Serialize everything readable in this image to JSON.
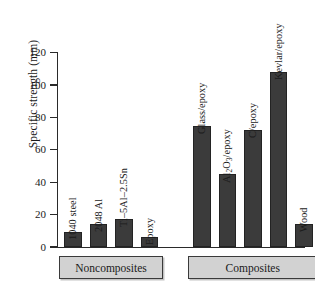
{
  "chart_data": {
    "type": "bar",
    "title": "",
    "xlabel": "",
    "ylabel": "Specific strength (mm)",
    "ylim": [
      0,
      120
    ],
    "yticks": [
      0,
      20,
      40,
      60,
      80,
      100,
      120
    ],
    "grid": false,
    "legend": null,
    "categories": [
      "1040 steel",
      "2048 Al",
      "Ti–5Al–2.5Sn",
      "Epoxy",
      "Glass/epoxy",
      "Al2O3/epoxy",
      "C/epoxy",
      "Kevlar/epoxy",
      "Wood"
    ],
    "values": [
      9,
      14,
      17,
      6,
      75,
      45,
      72,
      108,
      14
    ],
    "bars": [
      {
        "label": "1040 steel",
        "value": 9,
        "group": "Noncomposites"
      },
      {
        "label": "2048 Al",
        "value": 14,
        "group": "Noncomposites"
      },
      {
        "label": "Ti–5Al–2.5Sn",
        "value": 17,
        "group": "Noncomposites"
      },
      {
        "label": "Epoxy",
        "value": 6,
        "group": "Noncomposites"
      },
      {
        "label": "Glass/epoxy",
        "value": 75,
        "group": "Composites"
      },
      {
        "label": "Al2O3/epoxy",
        "value": 45,
        "group": "Composites",
        "label_parts": [
          {
            "t": "Al"
          },
          {
            "t": "2",
            "sub": true
          },
          {
            "t": "O"
          },
          {
            "t": "3",
            "sub": true
          },
          {
            "t": "/epoxy"
          }
        ]
      },
      {
        "label": "C/epoxy",
        "value": 72,
        "group": "Composites"
      },
      {
        "label": "Kevlar/epoxy",
        "value": 108,
        "group": "Composites"
      },
      {
        "label": "Wood",
        "value": 14,
        "group": "Composites"
      }
    ],
    "groups": [
      {
        "label": "Noncomposites",
        "bar_indices": [
          0,
          1,
          2,
          3
        ]
      },
      {
        "label": "Composites",
        "bar_indices": [
          4,
          5,
          6,
          7,
          8
        ]
      }
    ],
    "colors": {
      "bar_fill": "#3b3b3b",
      "bar_stroke": "#232323",
      "axis": "#2a2a2a",
      "group_box_fill": "#d2d2d2",
      "background": "#ffffff"
    }
  }
}
